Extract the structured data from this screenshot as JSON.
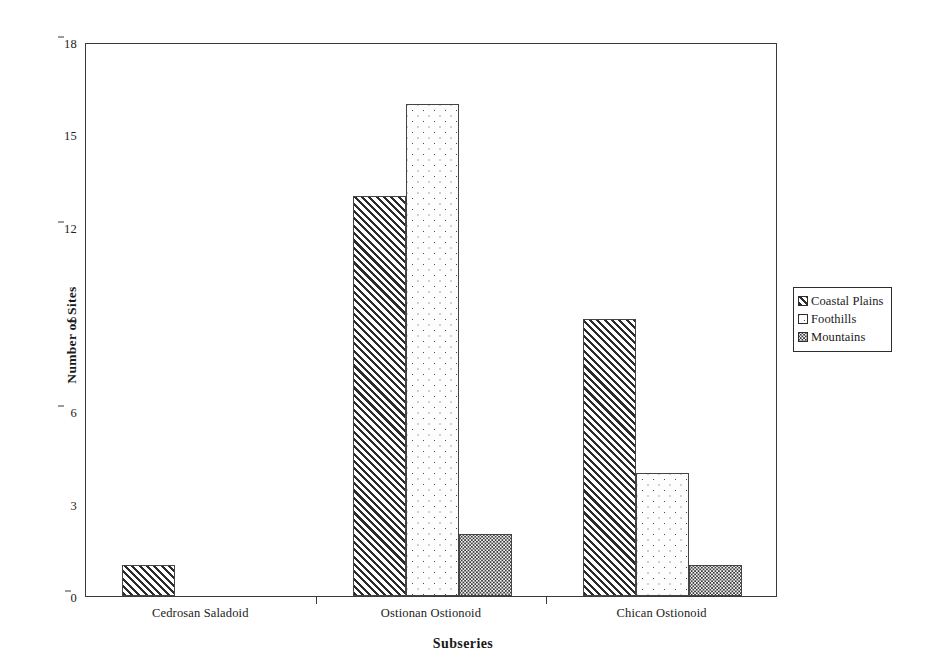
{
  "chart_data": {
    "type": "bar",
    "title": "",
    "xlabel": "Subseries",
    "ylabel": "Number of Sites",
    "categories": [
      "Cedrosan Saladoid",
      "Ostionan Ostionoid",
      "Chican Ostionoid"
    ],
    "series": [
      {
        "name": "Coastal Plains",
        "values": [
          1,
          13,
          9
        ],
        "pattern": "diagonal-hatch"
      },
      {
        "name": "Foothills",
        "values": [
          0,
          16,
          4
        ],
        "pattern": "sparse-dots"
      },
      {
        "name": "Mountains",
        "values": [
          0,
          2,
          1
        ],
        "pattern": "dense-dots"
      }
    ],
    "ylim": [
      0,
      18
    ],
    "yticks": [
      "0",
      "3",
      "6",
      "9",
      "12",
      "15",
      "18"
    ],
    "ytick_values": [
      0,
      3,
      6,
      9,
      12,
      15,
      18
    ],
    "grid": false,
    "legend_position": "right-outside",
    "frame": true
  },
  "axes": {
    "y_title": "Number of Sites",
    "x_title": "Subseries"
  },
  "legend": {
    "entries": [
      {
        "label": "Coastal Plains"
      },
      {
        "label": "Foothills"
      },
      {
        "label": "Mountains"
      }
    ]
  },
  "colors": {
    "axis": "#3a3a3a",
    "text": "#1a1a1a",
    "background": "#ffffff",
    "pattern_ink": "#2b2b2b"
  }
}
